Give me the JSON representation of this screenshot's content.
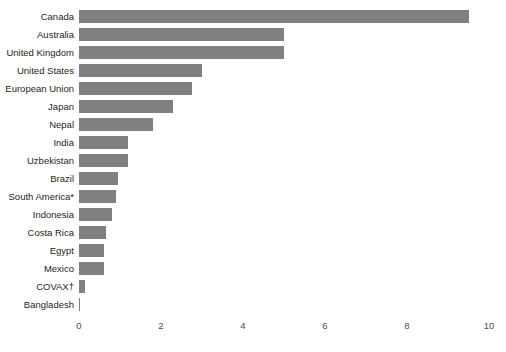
{
  "chart_data": {
    "type": "bar",
    "orientation": "horizontal",
    "title": "",
    "subtitle": "",
    "xlabel": "",
    "ylabel": "",
    "xlim": [
      0,
      10
    ],
    "xticks": [
      0,
      2,
      4,
      6,
      8,
      10
    ],
    "xtick_labels": [
      "0",
      "2",
      "4",
      "6",
      "8",
      "10"
    ],
    "grid": false,
    "legend": null,
    "bar_color": "#808080",
    "categories": [
      "Canada",
      "Australia",
      "United Kingdom",
      "United States",
      "European Union",
      "Japan",
      "Nepal",
      "India",
      "Uzbekistan",
      "Brazil",
      "South America*",
      "Indonesia",
      "Costa Rica",
      "Egypt",
      "Mexico",
      "COVAX†",
      "Bangladesh"
    ],
    "values": [
      9.5,
      5.0,
      5.0,
      3.0,
      2.75,
      2.3,
      1.8,
      1.2,
      1.2,
      0.95,
      0.9,
      0.8,
      0.65,
      0.62,
      0.6,
      0.15,
      0.02
    ],
    "annotations": [
      "* South America",
      "† COVAX"
    ]
  }
}
